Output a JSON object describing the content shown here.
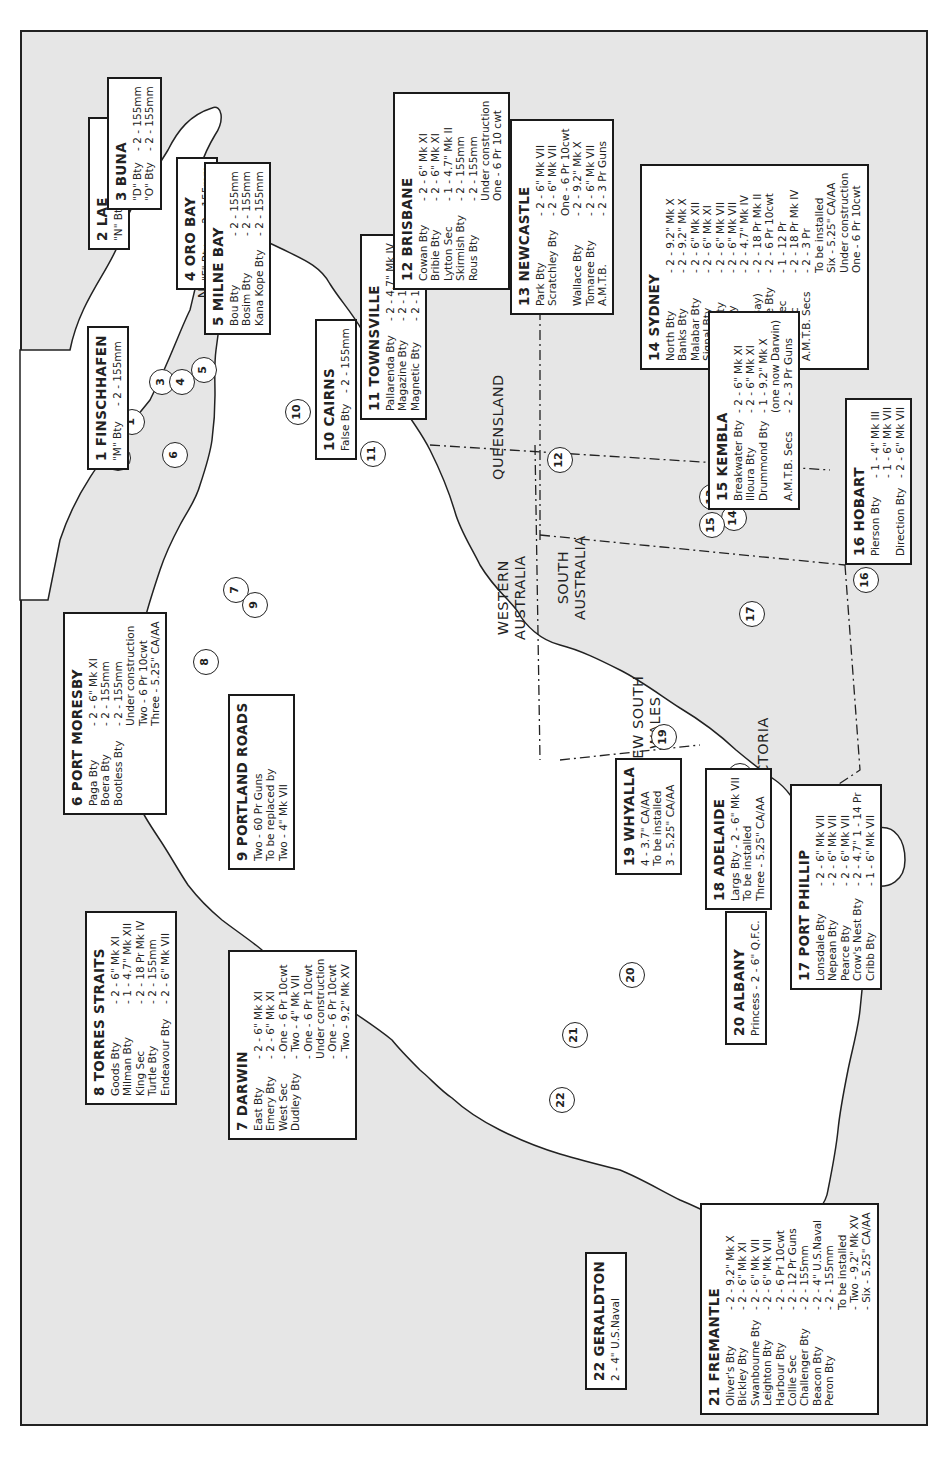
{
  "map": {
    "orientation": "rotated 90 degrees counter-clockwise",
    "colors": {
      "sea": "#e6e6e6",
      "land": "#ffffff",
      "border": "#222222"
    },
    "regions": [
      {
        "label": "NEW GUINEA",
        "lines": [
          "NEW",
          "GUINEA"
        ]
      },
      {
        "label": "QUEENSLAND",
        "lines": [
          "QUEENSLAND"
        ]
      },
      {
        "label": "NORTHERN TERRITORY",
        "lines": [
          "NORTHERN",
          "TERRITORY"
        ]
      },
      {
        "label": "WESTERN AUSTRALIA",
        "lines": [
          "WESTERN",
          "AUSTRALIA"
        ]
      },
      {
        "label": "SOUTH AUSTRALIA",
        "lines": [
          "SOUTH",
          "AUSTRALIA"
        ]
      },
      {
        "label": "NEW SOUTH WALES",
        "lines": [
          "NEW SOUTH",
          "WALES"
        ]
      },
      {
        "label": "VICTORIA",
        "lines": [
          "VICTORIA"
        ]
      },
      {
        "label": "TASMANIA",
        "lines": [
          "TASMANIA"
        ]
      }
    ],
    "markers": [
      "1",
      "2",
      "3",
      "4",
      "5",
      "6",
      "7",
      "8",
      "9",
      "10",
      "11",
      "12",
      "13",
      "14",
      "15",
      "16",
      "17",
      "18",
      "19",
      "20",
      "21",
      "22"
    ]
  },
  "locations": [
    {
      "id": "1",
      "title": "1  FINSCHHAFEN",
      "rows": [
        {
          "name": "\"M\" Bty",
          "value": "- 2 - 155mm"
        }
      ]
    },
    {
      "id": "2",
      "title": "2  LAE",
      "rows": [
        {
          "name": "\"N\" Bty",
          "value": "- 2 - 155mm"
        }
      ]
    },
    {
      "id": "3",
      "title": "3  BUNA",
      "rows": [
        {
          "name": "\"D\" Bty",
          "value": "- 2 - 155mm"
        },
        {
          "name": "\"O\" Bty",
          "value": "- 2 - 155mm"
        }
      ]
    },
    {
      "id": "4",
      "title": "4  ORO BAY",
      "rows": [
        {
          "name": "\"F\" Bty",
          "value": "- 2 - 155mm"
        }
      ]
    },
    {
      "id": "5",
      "title": "5  MILNE BAY",
      "rows": [
        {
          "name": "Bou Bty",
          "value": "- 2 - 155mm"
        },
        {
          "name": "Bosim Bty",
          "value": "- 2 - 155mm"
        },
        {
          "name": "Kana Kope Bty",
          "value": "- 2 - 155mm"
        }
      ]
    },
    {
      "id": "6",
      "title": "6  PORT MORESBY",
      "rows": [
        {
          "name": "Paga Bty",
          "value": "- 2 - 6\" Mk XI"
        },
        {
          "name": "Boera Bty",
          "value": "- 2 - 155mm"
        },
        {
          "name": "Bootless Bty",
          "value": "- 2 - 155mm"
        }
      ],
      "notes": [
        "Under construction",
        "Two - 6 Pr 10cwt",
        "Three - 5.25\" CA/AA"
      ]
    },
    {
      "id": "7",
      "title": "7  DARWIN",
      "rows": [
        {
          "name": "East Bty",
          "value": "- 2 - 6\" Mk XI"
        },
        {
          "name": "Emery Bty",
          "value": "- 2 - 6\" Mk XI"
        },
        {
          "name": "West Sec",
          "value": "- One - 6 Pr 10cwt"
        },
        {
          "name": "Dudley Bty",
          "value": "- Two - 4\" Mk VII"
        }
      ],
      "notes": [
        "- One - 6 Pr 10cwt",
        "Under construction",
        "- One - 6 Pr 10cwt",
        "- Two - 9.2\" Mk XV"
      ]
    },
    {
      "id": "8",
      "title": "8  TORRES STRAITS",
      "rows": [
        {
          "name": "Goods Bty",
          "value": "- 2 - 6\" Mk XI"
        },
        {
          "name": "Milman Bty",
          "value": "- 1 - 4.7\" Mk XII"
        },
        {
          "name": "King Sec",
          "value": "- 2 - 18 Pr Mk IV"
        },
        {
          "name": "Turtle Bty",
          "value": "- 2 - 155mm"
        },
        {
          "name": "Endeavour Bty",
          "value": "- 2 - 6\" Mk VII"
        }
      ]
    },
    {
      "id": "9",
      "title": "9  PORTLAND ROADS",
      "lines": [
        "Two - 60 Pr Guns",
        "To be replaced by",
        "Two - 4\" Mk VII"
      ]
    },
    {
      "id": "10",
      "title": "10  CAIRNS",
      "rows": [
        {
          "name": "False Bty",
          "value": "- 2 - 155mm"
        }
      ]
    },
    {
      "id": "11",
      "title": "11  TOWNSVILLE",
      "rows": [
        {
          "name": "Pallarenda Bty",
          "value": "- 2 - 4.7\" Mk IV"
        },
        {
          "name": "Magazine Bty",
          "value": "- 2 - 155mm"
        },
        {
          "name": "Magnetic Bty",
          "value": "- 2 - 155mm"
        }
      ]
    },
    {
      "id": "12",
      "title": "12  BRISBANE",
      "rows": [
        {
          "name": "Cowan Bty",
          "value": "- 2 - 6\" Mk XI"
        },
        {
          "name": "Bribie Bty",
          "value": "- 2 - 6\" Mk XI"
        },
        {
          "name": "Lytton Sec",
          "value": "- 1 - 4.7\" Mk II"
        },
        {
          "name": "Skirmish Bty",
          "value": "- 2 - 155mm"
        },
        {
          "name": "Rous Bty",
          "value": "- 2 - 155mm"
        }
      ],
      "notes": [
        "Under construction",
        "One - 6 Pr 10 cwt"
      ]
    },
    {
      "id": "13",
      "title": "13  NEWCASTLE",
      "rows": [
        {
          "name": "Park  Bty",
          "value": "- 2 - 6\" Mk VII"
        },
        {
          "name": "Scratchley Bty",
          "value": "- 2 - 6\" Mk VII"
        },
        {
          "name": "",
          "value": "One - 6 Pr 10cwt"
        },
        {
          "name": "Wallace Bty",
          "value": "- 2 - 9.2\" Mk X"
        },
        {
          "name": "Tomaree Bty",
          "value": "- 2 - 6\" Mk VII"
        },
        {
          "name": "A.M.T.B.",
          "value": "- 2 - 3 Pr Guns"
        }
      ]
    },
    {
      "id": "14",
      "title": "14  SYDNEY",
      "rows": [
        {
          "name": "North Bty",
          "value": "- 2 - 9.2\" Mk X"
        },
        {
          "name": "Banks Bty",
          "value": "- 2 - 9.2\" Mk X"
        },
        {
          "name": "Malabar Bty",
          "value": "- 2 - 6\" Mk XII"
        },
        {
          "name": "Signal Bty",
          "value": "- 2 - 6\" Mk XI"
        },
        {
          "name": "Hornby Bty",
          "value": "- 2 - 6\" Mk VII"
        },
        {
          "name": "Middle Bty",
          "value": "- 2 - 6\" Mk VII"
        },
        {
          "name": "West Bty",
          "value": "- 2 - 4.7\" Mk IV"
        },
        {
          "name": "(Broken Bay)",
          "value": "- 2 - 18 Pr Mk II"
        },
        {
          "name": "Casemate Bty",
          "value": "- 2 - 6 Pr 10cwt"
        },
        {
          "name": "Shelley Sec",
          "value": "- 1 - 12 Pr"
        },
        {
          "name": "Henry Sec",
          "value": "- 2 - 18 Pr Mk IV"
        },
        {
          "name": "A.M.T.B. Secs",
          "value": "- 2 - 3 Pr"
        }
      ],
      "notes": [
        "To be installed",
        "Six - 5.25\" CA/AA",
        "Under construction",
        "One - 6 Pr 10cwt"
      ]
    },
    {
      "id": "15",
      "title": "15  KEMBLA",
      "rows": [
        {
          "name": "Breakwater Bty",
          "value": "- 2 - 6\" Mk XI"
        },
        {
          "name": "Illoura Bty",
          "value": "- 2 - 6\" Mk XI"
        },
        {
          "name": "Drummond Bty",
          "value": "- 1 - 9.2\" Mk X"
        },
        {
          "name": "",
          "value": "(one now Darwin)"
        },
        {
          "name": "A.M.T.B. Secs",
          "value": "- 2 - 3 Pr Guns"
        }
      ]
    },
    {
      "id": "16",
      "title": "16  HOBART",
      "rows": [
        {
          "name": "Pierson Bty",
          "value": "- 1 - 4\" Mk III"
        },
        {
          "name": "",
          "value": "- 1 - 6\" Mk VII"
        },
        {
          "name": "Direction Bty",
          "value": "- 2 - 6\" Mk VII"
        }
      ]
    },
    {
      "id": "17",
      "title": "17  PORT PHILLIP",
      "rows": [
        {
          "name": "Lonsdale Bty",
          "value": "- 2 - 6\" Mk VII"
        },
        {
          "name": "Nepean Bty",
          "value": "- 2 - 6\" Mk VII"
        },
        {
          "name": "Pearce Bty",
          "value": "- 2 - 6\" Mk VII"
        },
        {
          "name": "Crow's Nest Bty",
          "value": "- 2 - 4.7\" 1 - 14 Pr"
        },
        {
          "name": "Cribb Bty",
          "value": "- 1 - 6\" Mk VII"
        }
      ]
    },
    {
      "id": "18",
      "title": "18  ADELAIDE",
      "lines": [
        "Largs Bty - 2 - 6\" Mk VII",
        "To be installed",
        "Three - 5.25\" CA/AA"
      ]
    },
    {
      "id": "19",
      "title": "19  WHYALLA",
      "lines": [
        "4 - 3.7\" CA/AA",
        "To be installed",
        "3 - 5.25\" CA/AA"
      ]
    },
    {
      "id": "20",
      "title": "20  ALBANY",
      "lines": [
        "Princess - 2 - 6\" Q.F.C."
      ]
    },
    {
      "id": "21",
      "title": "21  FREMANTLE",
      "rows": [
        {
          "name": "Oliver's Bty",
          "value": "- 2 - 9.2\" Mk X"
        },
        {
          "name": "Bickley Bty",
          "value": "- 2 - 6\" Mk XI"
        },
        {
          "name": "Swanbourne Bty",
          "value": "- 2 - 6\" Mk VII"
        },
        {
          "name": "Leighton Bty",
          "value": "- 2 - 6\" Mk VII"
        },
        {
          "name": "Harbour Bty",
          "value": "- 2 - 6 Pr 10cwt"
        },
        {
          "name": "Collie Sec",
          "value": "- 2 - 12 Pr Guns"
        },
        {
          "name": "Challenger Bty",
          "value": "- 2 - 155mm"
        },
        {
          "name": "Beacon Bty",
          "value": "- 2 - 4\" U.S.Naval"
        },
        {
          "name": "Peron Bty",
          "value": "- 2 - 155mm"
        }
      ],
      "notes": [
        "To be installed",
        "- Two - 9.2\" Mk XV",
        "- Six - 5.25\" CA/AA"
      ]
    },
    {
      "id": "22",
      "title": "22  GERALDTON",
      "lines": [
        "2 - 4\" U.S.Naval"
      ]
    }
  ]
}
